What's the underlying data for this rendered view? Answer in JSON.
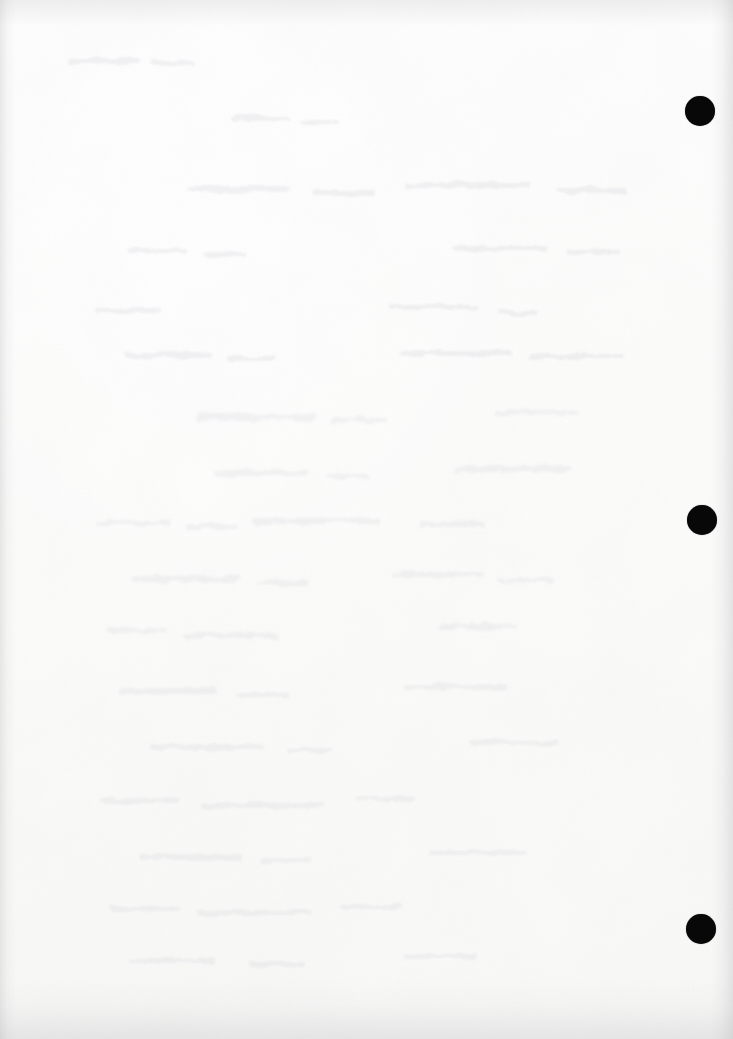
{
  "page": {
    "kind": "scanned-blank-page",
    "width": 733,
    "height": 1039,
    "paper_color": "#fdfdfd",
    "ink_color": "#080808",
    "visible_text": "",
    "notes_label": ""
  },
  "marks": {
    "label": "",
    "count": 3,
    "shape": "filled-circle",
    "color": "#080808",
    "items": [
      {
        "name": "punch-mark-top",
        "cx": 700,
        "cy": 111,
        "d": 30
      },
      {
        "name": "punch-mark-middle",
        "cx": 702,
        "cy": 520,
        "d": 30
      },
      {
        "name": "punch-mark-bottom",
        "cx": 701,
        "cy": 929,
        "d": 30
      }
    ]
  },
  "texture": {
    "grain_color": "#d9d9dc",
    "bleed_color": "#e2e2e6",
    "edge_shadow_color": "#b4b4b8"
  }
}
